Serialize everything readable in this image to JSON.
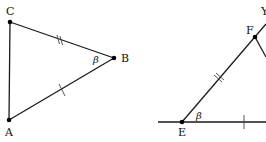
{
  "figure_left": {
    "points": {
      "C": {
        "label": "C",
        "x": 10,
        "y": 22
      },
      "B": {
        "label": "B",
        "x": 114,
        "y": 58
      },
      "A": {
        "label": "A",
        "x": 9,
        "y": 120
      }
    },
    "angle_label": "β",
    "segments": [
      {
        "from": "C",
        "to": "A",
        "marks": 0
      },
      {
        "from": "C",
        "to": "B",
        "marks": 2
      },
      {
        "from": "A",
        "to": "B",
        "marks": 1
      }
    ]
  },
  "figure_right": {
    "points": {
      "E": {
        "label": "E",
        "x": 182,
        "y": 122
      },
      "F": {
        "label": "F",
        "x": 255,
        "y": 37
      },
      "Y": {
        "label": "Y"
      }
    },
    "angle_label": "β",
    "segments": [
      {
        "from": "E",
        "to": "F",
        "marks": 2
      },
      {
        "name": "baseline",
        "marks": 1
      }
    ]
  },
  "colors": {
    "stroke": "#1a1a1a",
    "background": "#ffffff"
  }
}
